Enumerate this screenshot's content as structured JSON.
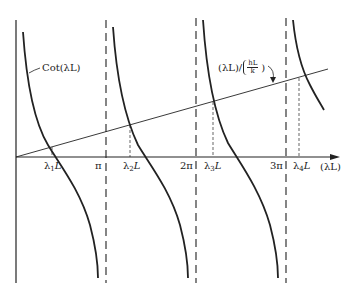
{
  "figure": {
    "curve_label": "Cot(λL)",
    "line_label_left": "(λL)/",
    "line_label_frac_num": "hL",
    "line_label_frac_den": "k",
    "x_axis_label": "(λL)",
    "ticks": [
      {
        "label": "π",
        "x": 106
      },
      {
        "label": "2π",
        "x": 196
      },
      {
        "label": "3π",
        "x": 286
      }
    ],
    "roots": [
      {
        "label_sym": "λ",
        "label_sub": "1",
        "label_tail": "L",
        "x": 52
      },
      {
        "label_sym": "λ",
        "label_sub": "2",
        "label_tail": "L",
        "x": 130
      },
      {
        "label_sym": "λ",
        "label_sub": "3",
        "label_tail": "L",
        "x": 213
      },
      {
        "label_sym": "λ",
        "label_sub": "4",
        "label_tail": "L",
        "x": 299
      }
    ],
    "colors": {
      "ink": "#222222",
      "background": "#ffffff"
    }
  }
}
